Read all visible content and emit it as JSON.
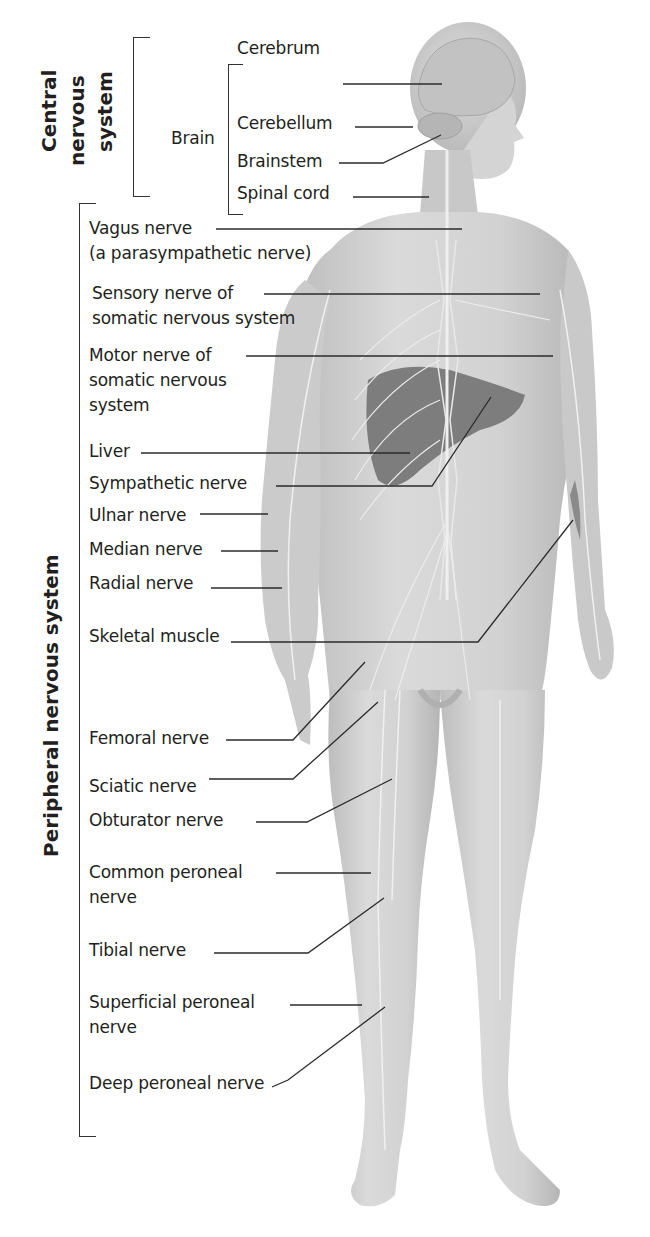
{
  "diagram": {
    "groups": [
      {
        "id": "cns",
        "label_lines": [
          "Central",
          "nervous",
          "system"
        ]
      },
      {
        "id": "pns",
        "label_lines": [
          "Peripheral nervous system"
        ]
      }
    ],
    "brain_label": "Brain",
    "labels": [
      {
        "id": "cerebrum",
        "lines": [
          "Cerebrum"
        ],
        "x": 237,
        "y": 40
      },
      {
        "id": "cerebellum",
        "lines": [
          "Cerebellum"
        ],
        "x": 237,
        "y": 115
      },
      {
        "id": "brainstem",
        "lines": [
          "Brainstem"
        ],
        "x": 237,
        "y": 153
      },
      {
        "id": "spinal-cord",
        "lines": [
          "Spinal cord"
        ],
        "x": 237,
        "y": 185
      },
      {
        "id": "vagus-nerve",
        "lines": [
          "Vagus nerve",
          "(a parasympathetic nerve)"
        ],
        "x": 89,
        "y": 218
      },
      {
        "id": "sensory-nerve",
        "lines": [
          "Sensory nerve of",
          "somatic nervous system"
        ],
        "x": 92,
        "y": 283
      },
      {
        "id": "motor-nerve",
        "lines": [
          "Motor nerve of",
          "somatic nervous",
          "system"
        ],
        "x": 89,
        "y": 345
      },
      {
        "id": "liver",
        "lines": [
          "Liver"
        ],
        "x": 89,
        "y": 443
      },
      {
        "id": "sympathetic-nerve",
        "lines": [
          "Sympathetic nerve"
        ],
        "x": 89,
        "y": 475
      },
      {
        "id": "ulnar-nerve",
        "lines": [
          "Ulnar nerve"
        ],
        "x": 89,
        "y": 507
      },
      {
        "id": "median-nerve",
        "lines": [
          "Median nerve"
        ],
        "x": 89,
        "y": 541
      },
      {
        "id": "radial-nerve",
        "lines": [
          "Radial nerve"
        ],
        "x": 89,
        "y": 575
      },
      {
        "id": "skeletal-muscle",
        "lines": [
          "Skeletal muscle"
        ],
        "x": 89,
        "y": 628
      },
      {
        "id": "femoral-nerve",
        "lines": [
          "Femoral nerve"
        ],
        "x": 89,
        "y": 730
      },
      {
        "id": "sciatic-nerve",
        "lines": [
          "Sciatic nerve"
        ],
        "x": 89,
        "y": 778
      },
      {
        "id": "obturator-nerve",
        "lines": [
          "Obturator nerve"
        ],
        "x": 89,
        "y": 812
      },
      {
        "id": "common-peroneal-nerve",
        "lines": [
          "Common peroneal",
          "nerve"
        ],
        "x": 89,
        "y": 862
      },
      {
        "id": "tibial-nerve",
        "lines": [
          "Tibial nerve"
        ],
        "x": 89,
        "y": 942
      },
      {
        "id": "superficial-peroneal-nerve",
        "lines": [
          "Superficial peroneal",
          "nerve"
        ],
        "x": 89,
        "y": 992
      },
      {
        "id": "deep-peroneal-nerve",
        "lines": [
          "Deep peroneal nerve"
        ],
        "x": 89,
        "y": 1075
      }
    ],
    "leaders": [
      {
        "id": "cerebrum",
        "points": [
          [
            343,
            84
          ],
          [
            442,
            84
          ]
        ]
      },
      {
        "id": "cerebellum",
        "points": [
          [
            355,
            127
          ],
          [
            413,
            127
          ]
        ]
      },
      {
        "id": "brainstem",
        "points": [
          [
            339,
            163
          ],
          [
            383,
            163
          ],
          [
            441,
            135
          ]
        ]
      },
      {
        "id": "spinal-cord",
        "points": [
          [
            353,
            197
          ],
          [
            429,
            197
          ]
        ]
      },
      {
        "id": "vagus-nerve",
        "points": [
          [
            216,
            229
          ],
          [
            462,
            229
          ]
        ]
      },
      {
        "id": "sensory-nerve",
        "points": [
          [
            264,
            294
          ],
          [
            540,
            294
          ]
        ]
      },
      {
        "id": "motor-nerve",
        "points": [
          [
            246,
            356
          ],
          [
            553,
            356
          ]
        ]
      },
      {
        "id": "liver",
        "points": [
          [
            141,
            453
          ],
          [
            410,
            453
          ]
        ]
      },
      {
        "id": "sympathetic-nerve",
        "points": [
          [
            276,
            486
          ],
          [
            432,
            486
          ],
          [
            491,
            397
          ]
        ]
      },
      {
        "id": "ulnar-nerve",
        "points": [
          [
            200,
            514
          ],
          [
            268,
            514
          ]
        ]
      },
      {
        "id": "median-nerve",
        "points": [
          [
            221,
            551
          ],
          [
            278,
            551
          ]
        ]
      },
      {
        "id": "radial-nerve",
        "points": [
          [
            211,
            588
          ],
          [
            282,
            588
          ]
        ]
      },
      {
        "id": "skeletal-muscle",
        "points": [
          [
            231,
            642
          ],
          [
            478,
            642
          ],
          [
            573,
            520
          ]
        ]
      },
      {
        "id": "femoral-nerve",
        "points": [
          [
            226,
            740
          ],
          [
            293,
            740
          ],
          [
            365,
            662
          ]
        ]
      },
      {
        "id": "sciatic-nerve",
        "points": [
          [
            209,
            779
          ],
          [
            293,
            779
          ],
          [
            378,
            702
          ]
        ]
      },
      {
        "id": "obturator-nerve",
        "points": [
          [
            256,
            822
          ],
          [
            307,
            822
          ],
          [
            392,
            779
          ]
        ]
      },
      {
        "id": "common-peroneal-nerve",
        "points": [
          [
            276,
            873
          ],
          [
            371,
            873
          ]
        ]
      },
      {
        "id": "tibial-nerve",
        "points": [
          [
            214,
            953
          ],
          [
            308,
            953
          ],
          [
            384,
            898
          ]
        ]
      },
      {
        "id": "superficial-peroneal-nerve",
        "points": [
          [
            290,
            1005
          ],
          [
            362,
            1005
          ]
        ]
      },
      {
        "id": "deep-peroneal-nerve",
        "points": [
          [
            272,
            1087
          ],
          [
            288,
            1080
          ],
          [
            385,
            1007
          ]
        ]
      }
    ],
    "colors": {
      "text": "#231f20",
      "leader": "#2b2b2b",
      "skin": "#c9c9c9",
      "skin_light": "#dedede",
      "skin_dark": "#a9a9a9",
      "organ": "#7d7d7d",
      "nerve": "#f2f2f2"
    }
  }
}
